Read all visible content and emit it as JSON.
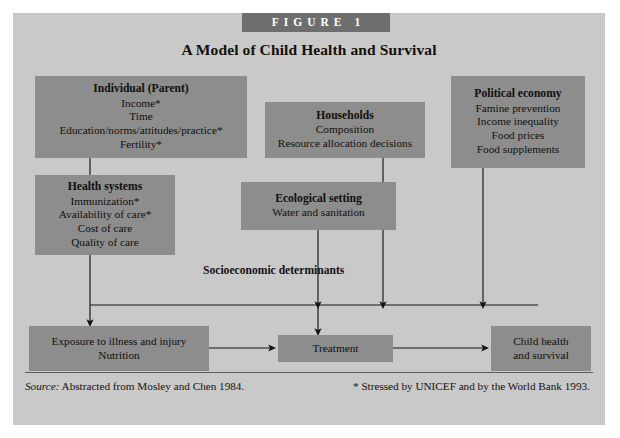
{
  "figure": {
    "tag": "FIGURE  1",
    "title": "A Model of Child Health and Survival",
    "mid_label": "Socioeconomic determinants"
  },
  "colors": {
    "page_background": "#ffffff",
    "panel_background": "#c9c9c9",
    "box_fill": "#8d8d8d",
    "tag_fill": "#6e6e6e",
    "tag_text": "#ffffff",
    "text": "#120f0c",
    "connector": "#141414"
  },
  "boxes": {
    "individual": {
      "heading": "Individual (Parent)",
      "lines": [
        "Income*",
        "Time",
        "Education/norms/attitudes/practice*",
        "Fertility*"
      ]
    },
    "households": {
      "heading": "Households",
      "lines": [
        "Composition",
        "Resource allocation decisions"
      ]
    },
    "political_economy": {
      "heading": "Political economy",
      "lines": [
        "Famine prevention",
        "Income inequality",
        "Food prices",
        "Food supplements"
      ]
    },
    "health_systems": {
      "heading": "Health systems",
      "lines": [
        "Immunization*",
        "Availability of care*",
        "Cost of care",
        "Quality of care"
      ]
    },
    "ecological_setting": {
      "heading": "Ecological setting",
      "lines": [
        "Water and sanitation"
      ]
    },
    "exposure": {
      "lines": [
        "Exposure to illness and injury",
        "Nutrition"
      ]
    },
    "treatment": {
      "lines": [
        "Treatment"
      ]
    },
    "child_health": {
      "lines": [
        "Child health",
        "and survival"
      ]
    }
  },
  "footer": {
    "source_label": "Source:",
    "source_text": " Abstracted from Mosley and Chen 1984.",
    "note": "* Stressed by UNICEF and by the World Bank 1993."
  }
}
